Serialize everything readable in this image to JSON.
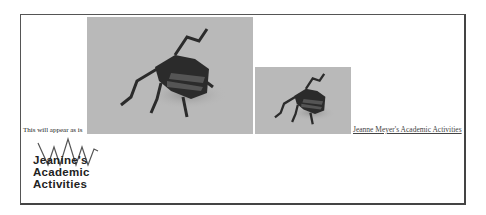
{
  "caption": "This will appear as is",
  "link": {
    "label": "Jeanne Meyer's Academic Activities"
  },
  "logo": {
    "lines": [
      "Jeanine's",
      "Academic",
      "Activities"
    ]
  },
  "images": [
    {
      "name": "origami-insect-large",
      "description": "origami beetle photo (large)"
    },
    {
      "name": "origami-insect-small",
      "description": "origami beetle photo (small)"
    }
  ],
  "colors": {
    "frame": "#555555",
    "photo_bg": "#b9b9b9",
    "insect": "#2a2a2a",
    "text": "#222222"
  }
}
